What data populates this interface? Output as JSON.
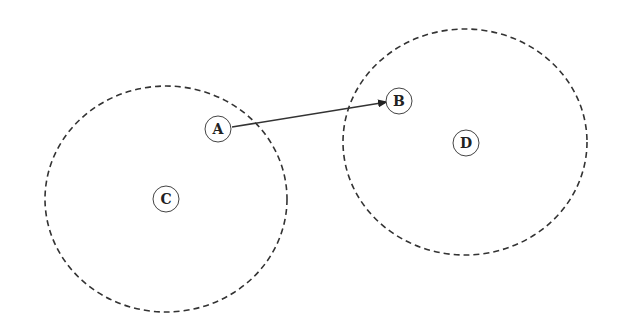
{
  "diagram": {
    "regions": [
      {
        "id": "C",
        "label": "C",
        "cx": 166,
        "cy": 199,
        "rx": 121,
        "ry": 113
      },
      {
        "id": "D",
        "label": "D",
        "cx": 465,
        "cy": 142,
        "rx": 122,
        "ry": 113
      }
    ],
    "nodes": [
      {
        "id": "A",
        "label": "A",
        "x": 218,
        "y": 129
      },
      {
        "id": "B",
        "label": "B",
        "x": 399,
        "y": 101
      },
      {
        "id": "C",
        "label": "C",
        "x": 166,
        "y": 199
      },
      {
        "id": "D",
        "label": "D",
        "x": 466,
        "y": 143
      }
    ],
    "edges": [
      {
        "from": "A",
        "to": "B",
        "directed": true
      }
    ],
    "colors": {
      "stroke": "#333333",
      "background": "#ffffff"
    }
  }
}
